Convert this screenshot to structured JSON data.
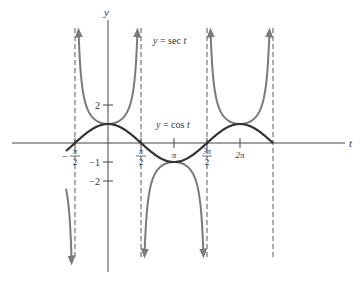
{
  "chart_data": {
    "type": "line",
    "title": "",
    "xlabel": "t",
    "ylabel": "y",
    "series": [
      {
        "name": "y = sec t",
        "label": "y = sec t",
        "color": "#7a7a7a",
        "function": "sec",
        "domain": [
          -2.0,
          7.2
        ]
      },
      {
        "name": "y = cos t",
        "label": "y = cos t",
        "color": "#333333",
        "function": "cos",
        "domain": [
          -2.0,
          7.854
        ]
      }
    ],
    "x_ticks": [
      {
        "value": -1.5708,
        "label_num": "π",
        "label_den": "2",
        "sign": "−"
      },
      {
        "value": 1.5708,
        "label_num": "π",
        "label_den": "2",
        "sign": ""
      },
      {
        "value": 3.1416,
        "label": "π"
      },
      {
        "value": 4.7124,
        "label_num": "3π",
        "label_den": "2",
        "sign": ""
      },
      {
        "value": 6.2832,
        "label": "2π"
      }
    ],
    "y_ticks": [
      {
        "value": 2,
        "label": "2"
      },
      {
        "value": -1,
        "label": "−1"
      },
      {
        "value": -2,
        "label": "−2"
      }
    ],
    "asymptotes": [
      -1.5708,
      1.5708,
      4.7124,
      7.854
    ],
    "xlim": [
      -2.4,
      8.4
    ],
    "ylim": [
      -7.2,
      7.0
    ],
    "grid": false,
    "legend": "inline labels"
  },
  "labels": {
    "y_axis": "y",
    "t_axis": "t",
    "sec": "y = sec t",
    "cos": "y = cos t"
  }
}
